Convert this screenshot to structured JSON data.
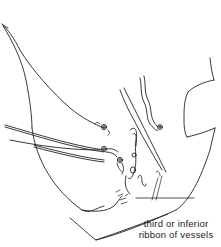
{
  "figure": {
    "type": "anatomical-line-drawing",
    "stroke_color": "#222222",
    "background": "#ffffff",
    "labels": [
      {
        "id": "inferior-ribbon-label",
        "lines": [
          "third or inferior",
          "ribbon of vessels"
        ],
        "x": 139,
        "y": 222
      }
    ]
  }
}
